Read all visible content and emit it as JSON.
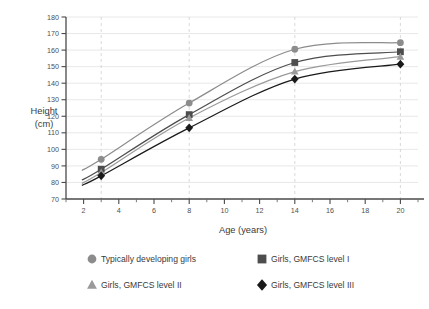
{
  "chart_data": {
    "type": "line",
    "title": "",
    "xlabel": "Age (years)",
    "ylabel": "Height\n(cm)",
    "ylabel_line1": "Height",
    "ylabel_line2": "(cm)",
    "x": [
      3,
      8,
      14,
      20
    ],
    "xlim": [
      1,
      21
    ],
    "ylim": [
      70,
      180
    ],
    "xticks": [
      2,
      4,
      6,
      8,
      10,
      12,
      14,
      16,
      18,
      20
    ],
    "xticks_labels": [
      "2",
      "4",
      "6",
      "8",
      "10",
      "12",
      "14",
      "16",
      "18",
      "20"
    ],
    "xticks_minor": [
      1,
      3,
      5,
      7,
      9,
      11,
      13,
      15,
      17,
      19,
      21
    ],
    "yticks": [
      70,
      80,
      90,
      100,
      110,
      120,
      130,
      140,
      150,
      160,
      170,
      180
    ],
    "yticks_labels": [
      "70",
      "80",
      "90",
      "100",
      "110",
      "120",
      "130",
      "140",
      "150",
      "160",
      "170",
      "180"
    ],
    "grid_horizontal": true,
    "grid_vertical_dashed_at": [
      3,
      8,
      14,
      20
    ],
    "legend_position": "bottom",
    "series": [
      {
        "name": "Typically developing girls",
        "marker": "circle",
        "color": "#8c8c8c",
        "values": [
          94,
          128,
          160.5,
          164.5
        ]
      },
      {
        "name": "Girls, GMFCS level I",
        "marker": "square",
        "color": "#4d4d4d",
        "values": [
          88,
          121,
          152.5,
          159
        ]
      },
      {
        "name": "Girls, GMFCS level II",
        "marker": "triangle",
        "color": "#9a9a9a",
        "values": [
          86,
          119,
          147,
          156
        ]
      },
      {
        "name": "Girls, GMFCS level III",
        "marker": "diamond",
        "color": "#1a1a1a",
        "values": [
          84,
          113,
          142.5,
          151.5
        ]
      }
    ]
  },
  "legend": {
    "items": [
      {
        "label": "Typically developing girls",
        "marker": "circle-marker",
        "color": "#8c8c8c"
      },
      {
        "label": "Girls, GMFCS level I",
        "marker": "square-marker",
        "color": "#4d4d4d"
      },
      {
        "label": "Girls, GMFCS level II",
        "marker": "triangle-marker",
        "color": "#9a9a9a"
      },
      {
        "label": "Girls, GMFCS level III",
        "marker": "diamond-marker",
        "color": "#1a1a1a"
      }
    ]
  }
}
